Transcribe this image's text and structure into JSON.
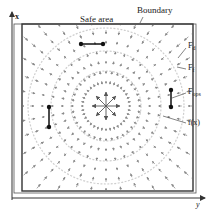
{
  "diagram": {
    "axes": {
      "vertical_label": "x",
      "horizontal_label": "y"
    },
    "labels": {
      "safe_area": "Safe area",
      "boundary": "Boundary",
      "f_d": {
        "main": "F",
        "sub": "d"
      },
      "f_f": {
        "main": "F",
        "sub": "f"
      },
      "f_ops": {
        "main": "F",
        "sub": "ops"
      },
      "fx": "f(x)"
    },
    "obstacles": [
      {
        "orientation": "horizontal",
        "x1": 81,
        "y1": 44,
        "x2": 103,
        "y2": 44
      },
      {
        "orientation": "vertical",
        "x1": 49,
        "y1": 107,
        "x2": 49,
        "y2": 127
      },
      {
        "orientation": "vertical",
        "x1": 171,
        "y1": 90,
        "x2": 171,
        "y2": 107
      }
    ],
    "field": {
      "center": [
        106,
        106
      ],
      "description": "radial vector field pointing outward from center toward boundary",
      "contour_radii": [
        35,
        55,
        78
      ]
    },
    "colors": {
      "line": "#333333",
      "arrow": "#8a8a8a",
      "contour": "#cfcfcf",
      "center_arrow": "#555555"
    }
  }
}
